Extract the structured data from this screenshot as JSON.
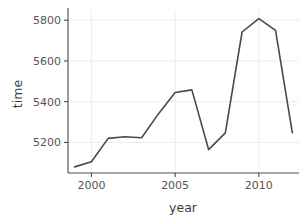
{
  "chart_data": {
    "type": "line",
    "title": "",
    "xlabel": "year",
    "ylabel": "time",
    "x": [
      1999,
      2000,
      2001,
      2002,
      2003,
      2004,
      2005,
      2006,
      2007,
      2008,
      2009,
      2010,
      2011,
      2012
    ],
    "values": [
      5080,
      5105,
      5220,
      5228,
      5223,
      5340,
      5445,
      5458,
      5165,
      5247,
      5742,
      5808,
      5750,
      5248
    ],
    "series": [
      {
        "name": "time",
        "values": [
          5080,
          5105,
          5220,
          5228,
          5223,
          5340,
          5445,
          5458,
          5165,
          5247,
          5742,
          5808,
          5750,
          5248
        ]
      }
    ],
    "xlim": [
      1998.6,
      2012.4
    ],
    "ylim": [
      5050,
      5850
    ],
    "xticks": [
      2000,
      2005,
      2010
    ],
    "xticklabels": [
      "2000",
      "2005",
      "2010"
    ],
    "yticks": [
      5200,
      5400,
      5600,
      5800
    ],
    "yticklabels": [
      "5200",
      "5400",
      "5600",
      "5800"
    ],
    "grid": true,
    "grid_axis": "both",
    "legend": false,
    "line_color": "#4a4a4a",
    "line_width": 1.6,
    "grid_color": "#ececf0",
    "axis_color": "#4d4d4d",
    "background": "#ffffff"
  },
  "axes": {
    "x_title": "year",
    "y_title": "time",
    "x_tick_labels": [
      "2000",
      "2005",
      "2010"
    ],
    "y_tick_labels": [
      "5200",
      "5400",
      "5600",
      "5800"
    ]
  }
}
